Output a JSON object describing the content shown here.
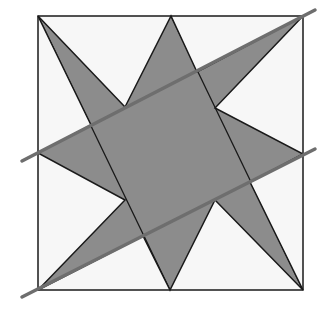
{
  "diagram": {
    "colors": {
      "background": "#ffffff",
      "square_fill": "#f7f7f7",
      "star_fill": "#8c8c8c",
      "stroke": "#1a1a1a",
      "cut_line": "#6e6e6e"
    },
    "square": {
      "x1": 38,
      "y1": 16,
      "x2": 303,
      "y2": 290
    },
    "star_points": "38,16 125,107 171,16 197,72 303,16 215,108 303,154 250,182 303,290 215,200 170,290 143,236 38,290 125,200 38,153 91,125",
    "inner_lines": [
      {
        "x1": 171,
        "y1": 16,
        "x2": 303,
        "y2": 290
      },
      {
        "x1": 38,
        "y1": 16,
        "x2": 170,
        "y2": 290
      },
      {
        "x1": 125,
        "y1": 107,
        "x2": 215,
        "y2": 108
      },
      {
        "x1": 125,
        "y1": 200,
        "x2": 215,
        "y2": 200
      }
    ],
    "cut_lines": [
      {
        "x1": 22,
        "y1": 161,
        "x2": 315,
        "y2": 10
      },
      {
        "x1": 22,
        "y1": 297,
        "x2": 315,
        "y2": 149
      }
    ]
  }
}
